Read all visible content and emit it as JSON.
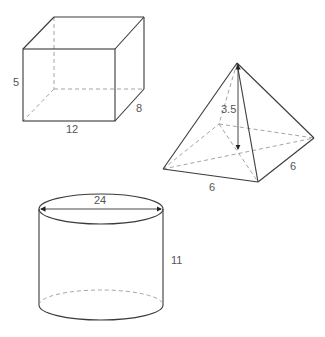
{
  "diagram": {
    "shapes": [
      {
        "type": "rectangular-prism",
        "labels": {
          "height": "5",
          "length": "12",
          "depth": "8"
        }
      },
      {
        "type": "square-pyramid",
        "labels": {
          "height": "3.5",
          "base_side_front": "6",
          "base_side_right": "6"
        }
      },
      {
        "type": "cylinder",
        "labels": {
          "diameter": "24",
          "height": "11"
        }
      }
    ]
  },
  "colors": {
    "line": "#3a3a3a",
    "hidden_line": "#9a9a9a",
    "label": "#555555"
  }
}
